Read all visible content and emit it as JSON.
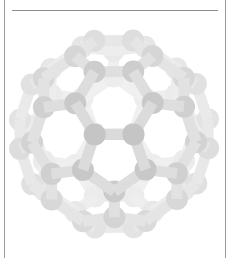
{
  "figure": {
    "atom_count": 60,
    "bond_count": 90,
    "colors": {
      "front_atom": "#c4c4c4",
      "back_atom": "#ececec",
      "bond": "#dcdcdc",
      "frame": "#9a9a9a",
      "background": "#ffffff"
    }
  }
}
